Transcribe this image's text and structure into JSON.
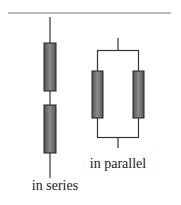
{
  "diagram": {
    "type": "resistor-circuits",
    "labels": {
      "series": "in series",
      "parallel": "in parallel"
    },
    "colors": {
      "wire": "#333333",
      "resistor_fill": "#707070",
      "resistor_stroke": "#222222",
      "separator": "#666666"
    }
  }
}
